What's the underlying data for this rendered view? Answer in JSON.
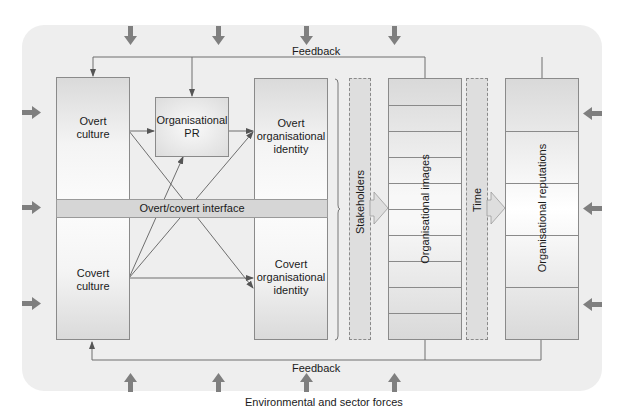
{
  "diagram": {
    "feedback_top": "Feedback",
    "feedback_bottom": "Feedback",
    "environment_caption": "Environmental and sector forces",
    "interface_band": "Overt/covert interface",
    "nodes": {
      "overt_culture": "Overt\nculture",
      "covert_culture": "Covert\nculture",
      "organisational_pr": "Organisational\nPR",
      "overt_identity": "Overt\norganisational\nidentity",
      "covert_identity": "Covert\norganisational\nidentity",
      "stakeholders": "Stakeholders",
      "organisational_images": "Organisational images",
      "time": "Time",
      "organisational_reputations": "Organisational reputations"
    },
    "edges": [
      {
        "from": "overt_culture",
        "to": "organisational_pr"
      },
      {
        "from": "overt_culture",
        "to": "covert_identity"
      },
      {
        "from": "organisational_pr",
        "to": "overt_identity"
      },
      {
        "from": "covert_culture",
        "to": "organisational_pr"
      },
      {
        "from": "covert_culture",
        "to": "overt_identity"
      },
      {
        "from": "covert_culture",
        "to": "covert_identity"
      },
      {
        "from": "organisational_images",
        "to": "overt_culture",
        "label": "Feedback"
      },
      {
        "from": "organisational_reputations",
        "to": "organisational_pr",
        "label": "Feedback"
      },
      {
        "from": "organisational_images",
        "to": "covert_culture",
        "label": "Feedback"
      },
      {
        "from": "stakeholders",
        "to": "organisational_images"
      },
      {
        "from": "time",
        "to": "organisational_reputations"
      }
    ],
    "image_rows": 10,
    "reputation_rows": 5,
    "force_arrows": {
      "top": 4,
      "bottom": 4,
      "left": 3,
      "right": 3
    },
    "colors": {
      "background": "#eeeeee",
      "arrow": "#7a7a7a",
      "line": "#6e6e6e",
      "band": "#d6d6d6"
    }
  }
}
